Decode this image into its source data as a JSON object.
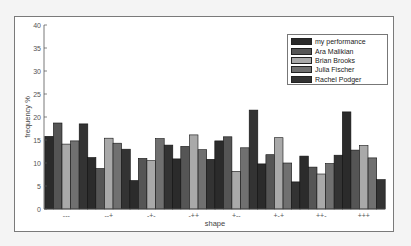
{
  "chart_data": {
    "type": "bar",
    "title": "",
    "xlabel": "shape",
    "ylabel": "frequency %",
    "ylim": [
      0,
      40
    ],
    "yticks": [
      0,
      5,
      10,
      15,
      20,
      25,
      30,
      35,
      40
    ],
    "grid": false,
    "legend_position": "upper right",
    "categories": [
      "---",
      "--+",
      "-+-",
      "-++",
      "+--",
      "+-+",
      "++-",
      "+++"
    ],
    "series": [
      {
        "name": "my performance",
        "color": "#2b2b2b",
        "values": [
          15.8,
          11.2,
          6.2,
          10.9,
          14.8,
          9.8,
          11.5,
          21.1
        ]
      },
      {
        "name": "Ara Malikian",
        "color": "#555555",
        "values": [
          18.7,
          8.8,
          11.0,
          13.6,
          15.7,
          11.8,
          9.1,
          12.8
        ]
      },
      {
        "name": "Brian Brooks",
        "color": "#a9a9a9",
        "values": [
          14.1,
          15.4,
          10.5,
          16.1,
          8.2,
          15.5,
          7.6,
          13.8
        ]
      },
      {
        "name": "Julia Fischer",
        "color": "#707070",
        "values": [
          14.8,
          14.3,
          15.3,
          12.9,
          13.3,
          10.0,
          9.9,
          11.1
        ]
      },
      {
        "name": "Rachel Podger",
        "color": "#333333",
        "values": [
          18.5,
          13.0,
          13.9,
          10.8,
          21.5,
          5.9,
          11.7,
          6.4
        ]
      }
    ]
  }
}
